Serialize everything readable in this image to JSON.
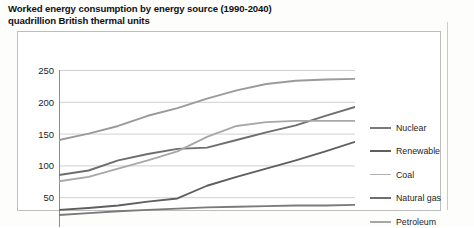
{
  "title": {
    "line1": "Worked energy consumption by energy source (1990-2040)",
    "line2": "quadrillion British thermal units"
  },
  "chart_data": {
    "type": "line",
    "title": "Worked energy consumption by energy source (1990-2040)",
    "subtitle": "quadrillion British thermal units",
    "xlabel": "",
    "ylabel": "quadrillion British thermal units",
    "x": [
      "1990",
      "1095",
      "2000",
      "2005",
      "2010",
      "2015",
      "2020",
      "2025",
      "2030",
      "2035",
      "2040"
    ],
    "xlim": [
      1990,
      2040
    ],
    "ylim": [
      0,
      250
    ],
    "yticks": [
      0,
      50,
      100,
      150,
      200,
      250
    ],
    "grid": true,
    "legend_position": "right",
    "series": [
      {
        "name": "Petroleum",
        "color": "#9a9a9a",
        "values": [
          140,
          150,
          162,
          178,
          190,
          205,
          218,
          228,
          233,
          235,
          236
        ]
      },
      {
        "name": "Natural gas",
        "color": "#6e6e6e",
        "values": [
          85,
          92,
          108,
          118,
          126,
          128,
          140,
          152,
          163,
          178,
          192
        ]
      },
      {
        "name": "Coal",
        "color": "#a8a8a8",
        "values": [
          75,
          82,
          95,
          108,
          122,
          145,
          162,
          168,
          170,
          170,
          170
        ]
      },
      {
        "name": "Renewable",
        "color": "#5f5f5f",
        "values": [
          30,
          33,
          37,
          43,
          48,
          68,
          82,
          95,
          108,
          122,
          137
        ]
      },
      {
        "name": "Nuclear",
        "color": "#7a7a7a",
        "values": [
          22,
          25,
          28,
          30,
          32,
          34,
          35,
          36,
          37,
          37,
          38
        ]
      }
    ]
  },
  "legend": {
    "items": [
      {
        "label": "Nuclear",
        "color": "#7a7a7a",
        "weight": 2.4
      },
      {
        "label": "Renewable",
        "color": "#5f5f5f",
        "weight": 2.6
      },
      {
        "label": "Coal",
        "color": "#b0b0b0",
        "weight": 1.8
      },
      {
        "label": "Natural gas",
        "color": "#6e6e6e",
        "weight": 2.6
      },
      {
        "label": "Petroleum",
        "color": "#a6a6a6",
        "weight": 2.0
      }
    ]
  }
}
